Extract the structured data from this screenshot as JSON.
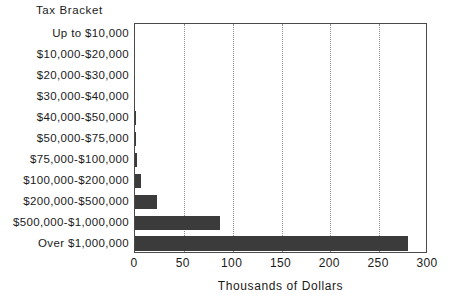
{
  "chart_data": {
    "type": "bar",
    "orientation": "horizontal",
    "title": "",
    "xlabel": "Thousands of Dollars",
    "ylabel": "Tax Bracket",
    "xlim": [
      0,
      300
    ],
    "xticks": [
      0,
      50,
      100,
      150,
      200,
      250,
      300
    ],
    "xtick_labels": [
      "0",
      "50",
      "100",
      "150",
      "200",
      "250",
      "300"
    ],
    "grid": "vertical-dotted",
    "legend": null,
    "bar_color": "#3b3b3b",
    "axis_color": "#4a4a4a",
    "gridline_color": "#8c8c8c",
    "categories": [
      "Up to $10,000",
      "$10,000-$20,000",
      "$20,000-$30,000",
      "$30,000-$40,000",
      "$40,000-$50,000",
      "$50,000-$75,000",
      "$75,000-$100,000",
      "$100,000-$200,000",
      "$200,000-$500,000",
      "$500,000-$1,000,000",
      "Over $1,000,000"
    ],
    "values": [
      0,
      0,
      0,
      0,
      0.6,
      0.8,
      2,
      6,
      23,
      87,
      280
    ]
  }
}
